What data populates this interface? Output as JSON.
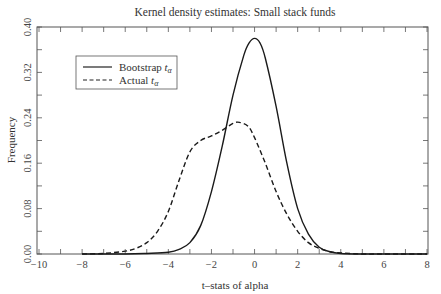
{
  "chart_data": {
    "type": "line",
    "title": "Kernel density estimates: Small stack funds",
    "xlabel": "t–stats of alpha",
    "ylabel": "Frequency",
    "xlim": [
      -10,
      8
    ],
    "ylim": [
      0,
      0.4
    ],
    "xticks": [
      -10,
      -8,
      -6,
      -4,
      -2,
      0,
      2,
      4,
      6,
      8
    ],
    "xtick_labels": [
      "−10",
      "−8",
      "−6",
      "−4",
      "−2",
      "0",
      "2",
      "4",
      "6",
      "8"
    ],
    "yticks": [
      0.0,
      0.08,
      0.16,
      0.24,
      0.32,
      0.4
    ],
    "ytick_labels": [
      "0.00",
      "0.08",
      "0.16",
      "0.24",
      "0.32",
      "0.40"
    ],
    "grid": false,
    "legend_position": "upper left",
    "series": [
      {
        "name": "Bootstrap tα",
        "legend_main": "Bootstrap ",
        "legend_sub": "α",
        "style": "solid",
        "x": [
          -8,
          -6,
          -5,
          -4,
          -3.5,
          -3,
          -2.5,
          -2,
          -1.5,
          -1,
          -0.5,
          -0.25,
          0,
          0.25,
          0.5,
          1,
          1.5,
          2,
          2.5,
          3,
          3.5,
          4,
          5,
          6,
          8
        ],
        "y": [
          0.0,
          0.0,
          0.001,
          0.003,
          0.008,
          0.02,
          0.05,
          0.11,
          0.19,
          0.28,
          0.35,
          0.372,
          0.38,
          0.372,
          0.345,
          0.26,
          0.16,
          0.08,
          0.035,
          0.012,
          0.004,
          0.001,
          0.0,
          0.0,
          0.0
        ]
      },
      {
        "name": "Actual tα",
        "legend_main": "Actual ",
        "legend_sub": "α",
        "style": "dashed",
        "x": [
          -8,
          -7,
          -6,
          -5.5,
          -5,
          -4.5,
          -4,
          -3.5,
          -3,
          -2.5,
          -2,
          -1.5,
          -1,
          -0.7,
          -0.3,
          0,
          0.5,
          1,
          1.5,
          2,
          2.5,
          3,
          3.5,
          4,
          5,
          6,
          8
        ],
        "y": [
          0.0,
          0.001,
          0.005,
          0.01,
          0.02,
          0.04,
          0.075,
          0.13,
          0.18,
          0.2,
          0.208,
          0.218,
          0.23,
          0.232,
          0.225,
          0.205,
          0.16,
          0.11,
          0.07,
          0.04,
          0.02,
          0.01,
          0.004,
          0.002,
          0.0,
          0.0,
          0.0
        ]
      }
    ]
  }
}
